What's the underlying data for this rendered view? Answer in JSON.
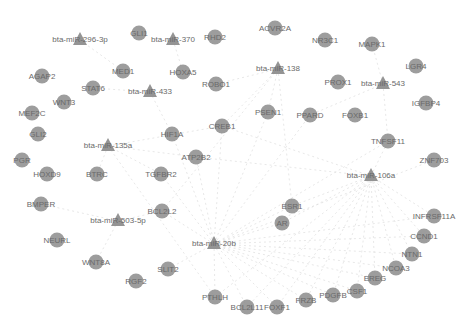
{
  "diagram": {
    "type": "mirna-gene-network",
    "node_color": "#8c8c8c",
    "edge_color": "#d6d6d6",
    "mirnas": [
      {
        "id": "m296",
        "label": "bta-miR-296-3p",
        "x": 80,
        "y": 40
      },
      {
        "id": "m370",
        "label": "bta-miR-370",
        "x": 173,
        "y": 40
      },
      {
        "id": "m138",
        "label": "bta-miR-138",
        "x": 278,
        "y": 69
      },
      {
        "id": "m543",
        "label": "bta-miR-543",
        "x": 383,
        "y": 84
      },
      {
        "id": "m433",
        "label": "bta-miR-433",
        "x": 150,
        "y": 92
      },
      {
        "id": "m135a",
        "label": "bta-miR-135a",
        "x": 108,
        "y": 146
      },
      {
        "id": "m106a",
        "label": "bta-miR-106a",
        "x": 371,
        "y": 176
      },
      {
        "id": "m503",
        "label": "bta-miR-503-5p",
        "x": 118,
        "y": 221
      },
      {
        "id": "m20b",
        "label": "bta-miR-20b",
        "x": 214,
        "y": 244
      }
    ],
    "genes": [
      {
        "label": "GLI1",
        "x": 139,
        "y": 33
      },
      {
        "label": "RHD2",
        "x": 215,
        "y": 37
      },
      {
        "label": "ACVR2A",
        "x": 275,
        "y": 28
      },
      {
        "label": "NR3C1",
        "x": 325,
        "y": 40
      },
      {
        "label": "MAPK1",
        "x": 372,
        "y": 44
      },
      {
        "label": "LGR4",
        "x": 416,
        "y": 66
      },
      {
        "label": "AGAP2",
        "x": 42,
        "y": 76
      },
      {
        "label": "MED1",
        "x": 123,
        "y": 71
      },
      {
        "label": "HOXA5",
        "x": 183,
        "y": 72
      },
      {
        "label": "STAT6",
        "x": 93,
        "y": 88
      },
      {
        "label": "ROBO1",
        "x": 216,
        "y": 84
      },
      {
        "label": "PROX1",
        "x": 338,
        "y": 82
      },
      {
        "label": "IGFBP4",
        "x": 426,
        "y": 103
      },
      {
        "label": "WNT3",
        "x": 64,
        "y": 102
      },
      {
        "label": "MEF2C",
        "x": 32,
        "y": 113
      },
      {
        "label": "PSEN1",
        "x": 268,
        "y": 112
      },
      {
        "label": "PPARD",
        "x": 310,
        "y": 115
      },
      {
        "label": "FOXB1",
        "x": 355,
        "y": 115
      },
      {
        "label": "GLI2",
        "x": 38,
        "y": 134
      },
      {
        "label": "HIF1A",
        "x": 172,
        "y": 134
      },
      {
        "label": "CREB1",
        "x": 222,
        "y": 126
      },
      {
        "label": "TNFSF11",
        "x": 388,
        "y": 141
      },
      {
        "label": "PGR",
        "x": 22,
        "y": 160
      },
      {
        "label": "ATP2B2",
        "x": 196,
        "y": 157
      },
      {
        "label": "ZNF703",
        "x": 434,
        "y": 160
      },
      {
        "label": "HOXD9",
        "x": 47,
        "y": 174
      },
      {
        "label": "BTRC",
        "x": 97,
        "y": 174
      },
      {
        "label": "TGFBR2",
        "x": 161,
        "y": 174
      },
      {
        "label": "BMPER",
        "x": 41,
        "y": 204
      },
      {
        "label": "ESR1",
        "x": 292,
        "y": 206
      },
      {
        "label": "BCL2L2",
        "x": 162,
        "y": 211
      },
      {
        "label": "AR",
        "x": 282,
        "y": 223
      },
      {
        "label": "INFRSF11A",
        "x": 434,
        "y": 216
      },
      {
        "label": "CCND1",
        "x": 424,
        "y": 236
      },
      {
        "label": "NEURL",
        "x": 57,
        "y": 240
      },
      {
        "label": "NTN1",
        "x": 412,
        "y": 254
      },
      {
        "label": "WNT8A",
        "x": 96,
        "y": 262
      },
      {
        "label": "SLIT2",
        "x": 168,
        "y": 269
      },
      {
        "label": "NCOA3",
        "x": 396,
        "y": 268
      },
      {
        "label": "RGF2",
        "x": 136,
        "y": 281
      },
      {
        "label": "EREG",
        "x": 375,
        "y": 278
      },
      {
        "label": "PTHLH",
        "x": 215,
        "y": 297
      },
      {
        "label": "CSF1",
        "x": 357,
        "y": 291
      },
      {
        "label": "PDGFB",
        "x": 333,
        "y": 295
      },
      {
        "label": "FRZB",
        "x": 306,
        "y": 300
      },
      {
        "label": "BCL2L11",
        "x": 247,
        "y": 307
      },
      {
        "label": "FOXF1",
        "x": 277,
        "y": 307
      }
    ],
    "edges": [
      [
        "m20b",
        "ESR1"
      ],
      [
        "m20b",
        "AR"
      ],
      [
        "m20b",
        "PTHLH"
      ],
      [
        "m20b",
        "BCL2L11"
      ],
      [
        "m20b",
        "FOXF1"
      ],
      [
        "m20b",
        "FRZB"
      ],
      [
        "m20b",
        "PDGFB"
      ],
      [
        "m20b",
        "CSF1"
      ],
      [
        "m20b",
        "EREG"
      ],
      [
        "m20b",
        "NCOA3"
      ],
      [
        "m20b",
        "NTN1"
      ],
      [
        "m20b",
        "CCND1"
      ],
      [
        "m20b",
        "INFRSF11A"
      ],
      [
        "m20b",
        "TNFSF11"
      ],
      [
        "m20b",
        "PSEN1"
      ],
      [
        "m20b",
        "CREB1"
      ],
      [
        "m20b",
        "ATP2B2"
      ],
      [
        "m20b",
        "HIF1A"
      ],
      [
        "m20b",
        "TGFBR2"
      ],
      [
        "m20b",
        "BCL2L2"
      ],
      [
        "m20b",
        "SLIT2"
      ],
      [
        "m20b",
        "PPARD"
      ],
      [
        "m20b",
        "ZNF703"
      ],
      [
        "m106a",
        "ESR1"
      ],
      [
        "m106a",
        "AR"
      ],
      [
        "m106a",
        "FOXF1"
      ],
      [
        "m106a",
        "FRZB"
      ],
      [
        "m106a",
        "PDGFB"
      ],
      [
        "m106a",
        "CSF1"
      ],
      [
        "m106a",
        "EREG"
      ],
      [
        "m106a",
        "NCOA3"
      ],
      [
        "m106a",
        "NTN1"
      ],
      [
        "m106a",
        "CCND1"
      ],
      [
        "m106a",
        "INFRSF11A"
      ],
      [
        "m106a",
        "ATP2B2"
      ],
      [
        "m106a",
        "CREB1"
      ],
      [
        "m106a",
        "BCL2L11"
      ],
      [
        "m106a",
        "PTHLH"
      ],
      [
        "m106a",
        "TNFSF11"
      ],
      [
        "m135a",
        "BTRC"
      ],
      [
        "m135a",
        "TGFBR2"
      ],
      [
        "m135a",
        "CREB1"
      ],
      [
        "m135a",
        "ATP2B2"
      ],
      [
        "m135a",
        "PTHLH"
      ],
      [
        "m138",
        "CREB1"
      ],
      [
        "m138",
        "PSEN1"
      ],
      [
        "m138",
        "ROBO1"
      ],
      [
        "m138",
        "BCL2L2"
      ],
      [
        "m138",
        "ESR1"
      ],
      [
        "m543",
        "TNFSF11"
      ],
      [
        "m543",
        "PPARD"
      ],
      [
        "m543",
        "MAPK1"
      ],
      [
        "m503",
        "BCL2L2"
      ],
      [
        "m503",
        "WNT8A"
      ],
      [
        "m503",
        "BMPER"
      ],
      [
        "m433",
        "HIF1A"
      ],
      [
        "m433",
        "STAT6"
      ],
      [
        "m370",
        "HOXA5"
      ],
      [
        "m296",
        "MED1"
      ]
    ]
  }
}
